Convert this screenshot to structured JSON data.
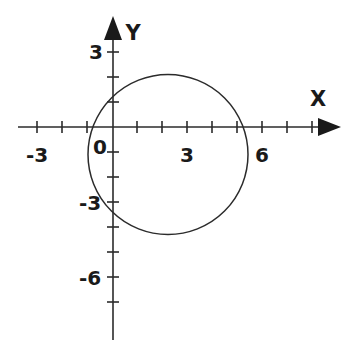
{
  "figure": {
    "title": "",
    "background_color": "#ffffff",
    "ink_color": "#2b2b2b",
    "width": 344,
    "height": 346
  },
  "axes": {
    "x_axis": {
      "name": "X",
      "label_glyph": "X",
      "tick_labels": [
        "-3",
        "0",
        "3",
        "6"
      ],
      "tick_label_values": [
        -3,
        0,
        3,
        6
      ],
      "minor_tick_step": 1,
      "range": [
        -4.4,
        8.6
      ],
      "arrow": "right"
    },
    "y_axis": {
      "name": "Y",
      "label_glyph": "Y",
      "tick_labels": [
        "3",
        "-3",
        "-6"
      ],
      "tick_label_values": [
        3,
        -3,
        -6
      ],
      "minor_tick_step": 1,
      "range": [
        -8.4,
        4.0
      ],
      "arrow": "up"
    },
    "origin_label": "0"
  },
  "chart_data": {
    "type": "line",
    "title": "",
    "subtitle": "",
    "xlabel": "X",
    "ylabel": "Y",
    "xlim": [
      -4.4,
      8.6
    ],
    "ylim": [
      -8.4,
      4.0
    ],
    "grid": false,
    "legend": null,
    "legend_position": "none",
    "x_ticks": [
      -3,
      0,
      3,
      6
    ],
    "x_tick_labels": [
      "-3",
      "0",
      "3",
      "6"
    ],
    "y_ticks": [
      3,
      -3,
      -6
    ],
    "y_tick_labels": [
      "3",
      "-3",
      "-6"
    ],
    "x_minor_tick_step": 1,
    "y_minor_tick_step": 1,
    "series": [
      {
        "name": "circle",
        "shape": "circle",
        "center": [
          2.2,
          -1.1
        ],
        "radius": 3.2,
        "x_intercepts": [
          -1.0,
          5.4
        ],
        "y_extent": [
          -4.3,
          2.1
        ],
        "closed": true,
        "stroke": "#2b2b2b",
        "fill": "none"
      }
    ],
    "annotations": []
  },
  "labels": {
    "x_neg3": "-3",
    "origin": "0",
    "x_pos3": "3",
    "x_pos6": "6",
    "y_pos3": "3",
    "y_neg3": "-3",
    "y_neg6": "-6",
    "x_axis_name": "X",
    "y_axis_name": "Y"
  }
}
